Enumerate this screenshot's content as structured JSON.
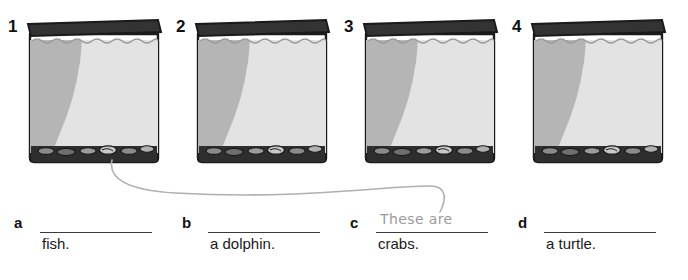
{
  "worksheet": {
    "type": "fill-in-the-blank-exercise",
    "tanks": [
      {
        "number": "1"
      },
      {
        "number": "2"
      },
      {
        "number": "3"
      },
      {
        "number": "4"
      }
    ],
    "answers": [
      {
        "letter": "a",
        "written": "",
        "tail": "fish."
      },
      {
        "letter": "b",
        "written": "",
        "tail": "a dolphin."
      },
      {
        "letter": "c",
        "written": "These are",
        "tail": "crabs."
      },
      {
        "letter": "d",
        "written": "",
        "tail": "a turtle."
      }
    ],
    "connector": {
      "from_tank": "1",
      "to_answer": "c"
    },
    "colors": {
      "lid": "#333333",
      "outline": "#1a1a1a",
      "water_dark": "#b5b5b5",
      "water_light": "#e3e3e3",
      "gravel": "#2e2e2e",
      "handwriting": "#9a9a9a",
      "rule": "#3a3a3a",
      "text": "#1a1a1a",
      "background": "#ffffff"
    }
  }
}
